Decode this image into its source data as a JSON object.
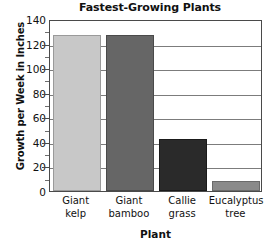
{
  "chart_data": {
    "type": "bar",
    "title": "Fastest-Growing Plants",
    "xlabel": "Plant",
    "ylabel": "Growth per Week in Inches",
    "categories": [
      "Giant kelp",
      "Giant bamboo",
      "Callie grass",
      "Eucalyptus tree"
    ],
    "category_lines": [
      [
        "Giant",
        "kelp"
      ],
      [
        "Giant",
        "bamboo"
      ],
      [
        "Callie",
        "grass"
      ],
      [
        "Eucalyptus",
        "tree"
      ]
    ],
    "values": [
      127,
      127,
      42,
      8
    ],
    "ylim": [
      0,
      140
    ],
    "ytick_labels": [
      "0",
      "20",
      "40",
      "60",
      "80",
      "100",
      "120",
      "140"
    ],
    "ytick_values": [
      0,
      20,
      40,
      60,
      80,
      100,
      120,
      140
    ],
    "yminor_values": [
      10,
      30,
      50,
      70,
      90,
      110,
      130
    ],
    "grid": "horizontal",
    "legend": "none",
    "bar_colors": [
      "#c8c8c8",
      "#666666",
      "#2a2a2a",
      "#8a8a8a"
    ],
    "bar_edge_colors": [
      "#9a9a9a",
      "#4a4a4a",
      "#1a1a1a",
      "#6a6a6a"
    ],
    "axis_color": "#4a4a4a",
    "grid_color": "#7c7c7c",
    "text_color": "#111111"
  }
}
